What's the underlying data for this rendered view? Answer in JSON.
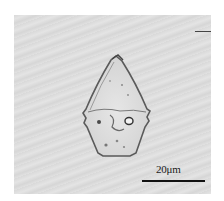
{
  "image": {
    "description": "Brightfield micrograph of a single transparent crystal with pointed apex",
    "background_color": "#dcdcdc",
    "crystal_outline_color": "#555555"
  },
  "scale_bar": {
    "label": "20μm",
    "color": "#111111"
  }
}
